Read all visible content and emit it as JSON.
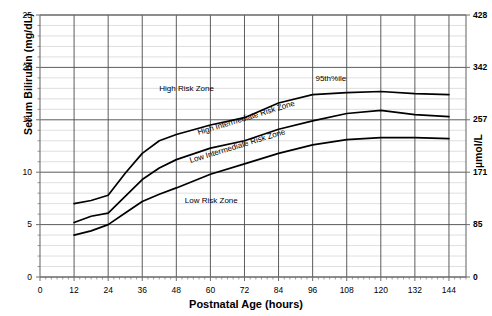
{
  "chart_data": {
    "type": "line",
    "title": "",
    "xlabel": "Postnatal Age (hours)",
    "ylabel": "Serum Bilirubin (mg/dL)",
    "ylabel_right": "µmol/L",
    "xlim": [
      0,
      150
    ],
    "ylim": [
      0,
      25
    ],
    "grid": true,
    "legend_position": "inline-annotations",
    "xticks": [
      0,
      12,
      24,
      36,
      48,
      60,
      72,
      84,
      96,
      108,
      120,
      132,
      144
    ],
    "xtick_labels": [
      "0",
      "12",
      "24",
      "36",
      "48",
      "60",
      "72",
      "84",
      "96",
      "108",
      "120",
      "132",
      "144"
    ],
    "yticks": [
      0,
      5,
      10,
      15,
      20,
      25
    ],
    "ytick_labels": [
      "0",
      "5",
      "10",
      "15",
      "20",
      "25"
    ],
    "yticks_right_values": [
      0,
      5,
      10,
      15,
      20,
      25
    ],
    "ytick_labels_right": [
      "0",
      "85",
      "171",
      "257",
      "342",
      "428"
    ],
    "yminor_step": 1,
    "xminor_step": 2,
    "x": [
      12,
      18,
      24,
      30,
      36,
      42,
      48,
      60,
      72,
      84,
      96,
      108,
      120,
      132,
      144
    ],
    "series": [
      {
        "name": "95th percentile (high risk zone upper bound)",
        "label": "95th%ile",
        "values": [
          7.0,
          7.3,
          7.8,
          9.9,
          11.8,
          13.0,
          13.6,
          14.5,
          15.2,
          16.6,
          17.4,
          17.6,
          17.7,
          17.5,
          17.4
        ]
      },
      {
        "name": "75th percentile (high intermediate / low intermediate boundary)",
        "label": "High Intermediate Risk Zone",
        "values": [
          5.2,
          5.8,
          6.1,
          7.7,
          9.3,
          10.4,
          11.2,
          12.3,
          13.0,
          14.1,
          14.9,
          15.6,
          15.9,
          15.5,
          15.3
        ]
      },
      {
        "name": "40th percentile (low risk zone upper bound)",
        "label": "Low Risk Zone",
        "values": [
          4.0,
          4.4,
          5.0,
          6.1,
          7.2,
          7.9,
          8.5,
          9.8,
          10.8,
          11.8,
          12.6,
          13.1,
          13.3,
          13.3,
          13.2
        ]
      }
    ],
    "annotations": [
      {
        "text": "High Risk Zone",
        "x": 42,
        "y": 17.8,
        "rotation": 0
      },
      {
        "text": "High Intermediate Risk Zone",
        "x": 56,
        "y": 13.6,
        "rotation": -17
      },
      {
        "text": "Low Intermediate Risk Zone",
        "x": 53,
        "y": 11.0,
        "rotation": -17
      },
      {
        "text": "Low Risk Zone",
        "x": 51,
        "y": 7.2,
        "rotation": 0
      },
      {
        "text": "95th%ile",
        "x": 97,
        "y": 18.8,
        "rotation": 0
      }
    ],
    "colors": {
      "curve": "#000000",
      "major_grid": "#4a4a4a",
      "minor_grid": "#c9c9c9",
      "axis": "#6e6e6e",
      "background": "#ffffff"
    }
  }
}
